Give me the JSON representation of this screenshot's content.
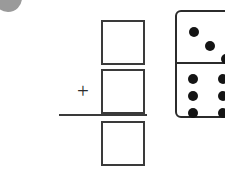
{
  "page": {
    "kind": "math-worksheet-fragment",
    "background_color": "#ffffff",
    "ink_color": "#2b2b2b"
  },
  "artifact": {
    "name": "scan-corner-smudge",
    "color": "#9a9a9a"
  },
  "problem": {
    "type": "vertical-addition",
    "operator": "+",
    "addend_1_value": "",
    "addend_1_placeholder": "",
    "addend_2_value": "",
    "addend_2_placeholder": "",
    "sum_value": "",
    "sum_placeholder": "",
    "box_border_color": "#3a3a3a",
    "rule_color": "#3a3a3a"
  },
  "domino": {
    "name": "domino-tile",
    "orientation": "vertical",
    "border_color": "#2b2b2b",
    "pip_color": "#141414",
    "top_half": {
      "count": 3,
      "arrangement": "diagonal",
      "pips": [
        {
          "x": 17,
          "y": 20
        },
        {
          "x": 33,
          "y": 34
        },
        {
          "x": 49,
          "y": 47
        }
      ]
    },
    "bottom_half": {
      "count": 6,
      "arrangement": "two-columns-of-three",
      "pips": [
        {
          "x": 16,
          "y": 15
        },
        {
          "x": 46,
          "y": 15
        },
        {
          "x": 16,
          "y": 32
        },
        {
          "x": 46,
          "y": 32
        },
        {
          "x": 16,
          "y": 49
        },
        {
          "x": 46,
          "y": 49
        }
      ]
    },
    "total_pips": 9
  }
}
